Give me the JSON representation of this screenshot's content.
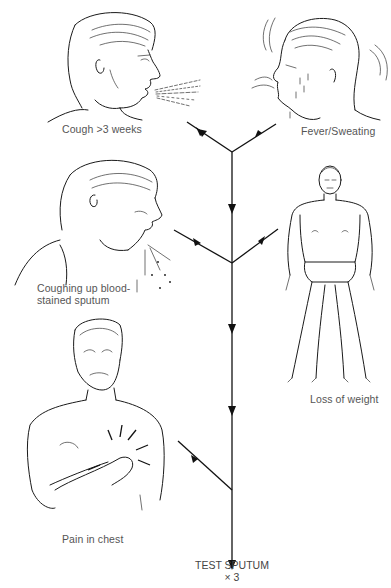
{
  "diagram": {
    "type": "symptom-convergence flowchart",
    "symptoms": [
      {
        "id": "cough",
        "label": "Cough >3 weeks"
      },
      {
        "id": "fever",
        "label": "Fever/Sweating"
      },
      {
        "id": "blood",
        "label": "Coughing up blood-stained sputum"
      },
      {
        "id": "weight",
        "label": "Loss of weight"
      },
      {
        "id": "chest",
        "label": "Pain in chest"
      }
    ],
    "outcome": {
      "line1": "TEST SPUTUM",
      "line2": "× 3"
    }
  }
}
